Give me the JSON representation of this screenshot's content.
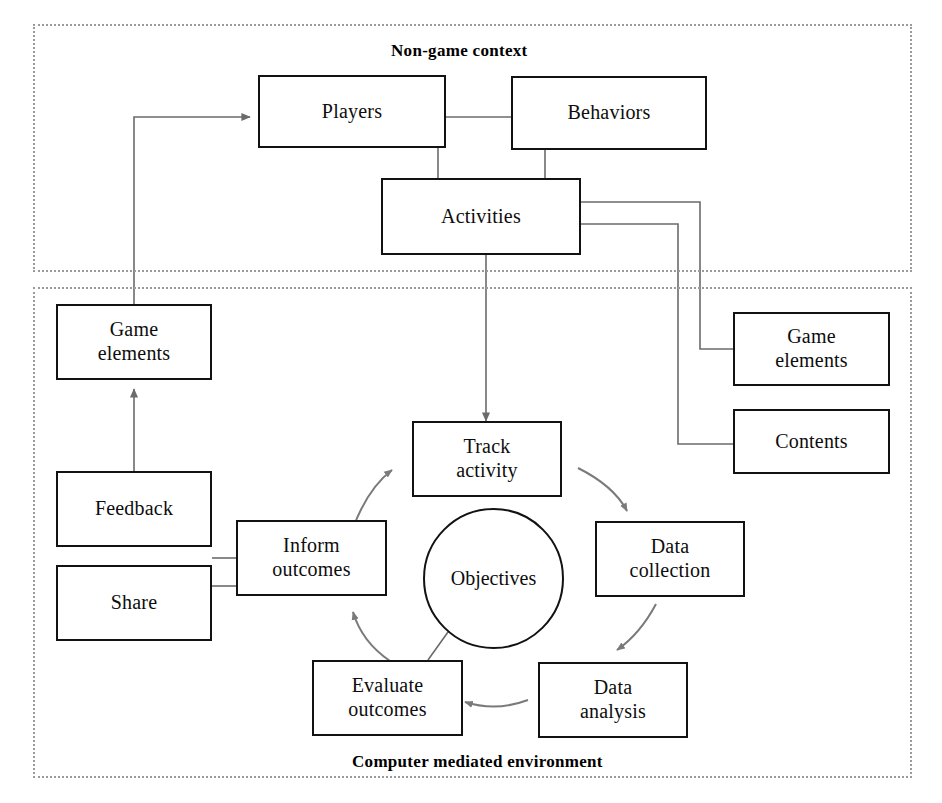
{
  "diagram": {
    "regions": [
      {
        "id": "non-game-context",
        "label": "Non-game context",
        "label_position": "top-center"
      },
      {
        "id": "computer-mediated-environment",
        "label": "Computer mediated environment",
        "label_position": "bottom-center"
      }
    ],
    "nodes": [
      {
        "id": "players",
        "label": "Players",
        "shape": "rect",
        "region": "non-game-context"
      },
      {
        "id": "behaviors",
        "label": "Behaviors",
        "shape": "rect",
        "region": "non-game-context"
      },
      {
        "id": "activities",
        "label": "Activities",
        "shape": "rect",
        "region": "non-game-context"
      },
      {
        "id": "game-elements-left",
        "label": "Game\nelements",
        "shape": "rect",
        "region": "computer-mediated-environment"
      },
      {
        "id": "feedback",
        "label": "Feedback",
        "shape": "rect",
        "region": "computer-mediated-environment"
      },
      {
        "id": "share",
        "label": "Share",
        "shape": "rect",
        "region": "computer-mediated-environment"
      },
      {
        "id": "inform-outcomes",
        "label": "Inform\noutcomes",
        "shape": "rect",
        "region": "computer-mediated-environment"
      },
      {
        "id": "track-activity",
        "label": "Track\nactivity",
        "shape": "rect",
        "region": "computer-mediated-environment"
      },
      {
        "id": "objectives",
        "label": "Objectives",
        "shape": "circle",
        "region": "computer-mediated-environment"
      },
      {
        "id": "data-collection",
        "label": "Data\ncollection",
        "shape": "rect",
        "region": "computer-mediated-environment"
      },
      {
        "id": "data-analysis",
        "label": "Data\nanalysis",
        "shape": "rect",
        "region": "computer-mediated-environment"
      },
      {
        "id": "evaluate-outcomes",
        "label": "Evaluate\noutcomes",
        "shape": "rect",
        "region": "computer-mediated-environment"
      },
      {
        "id": "game-elements-right",
        "label": "Game\nelements",
        "shape": "rect",
        "region": "computer-mediated-environment"
      },
      {
        "id": "contents",
        "label": "Contents",
        "shape": "rect",
        "region": "computer-mediated-environment"
      }
    ],
    "edges": [
      {
        "from": "players",
        "to": "behaviors",
        "style": "plain-line"
      },
      {
        "from": "players",
        "to": "activities",
        "style": "plain-line"
      },
      {
        "from": "behaviors",
        "to": "activities",
        "style": "plain-line"
      },
      {
        "from": "activities",
        "to": "track-activity",
        "style": "arrow"
      },
      {
        "from": "activities",
        "to": "game-elements-right",
        "style": "plain-line"
      },
      {
        "from": "activities",
        "to": "contents",
        "style": "plain-line"
      },
      {
        "from": "game-elements-left",
        "to": "players",
        "style": "arrow"
      },
      {
        "from": "feedback",
        "to": "game-elements-left",
        "style": "arrow"
      },
      {
        "from": "inform-outcomes",
        "to": "feedback",
        "style": "plain-line"
      },
      {
        "from": "inform-outcomes",
        "to": "share",
        "style": "plain-line"
      },
      {
        "from": "inform-outcomes",
        "to": "track-activity",
        "style": "curved-arrow"
      },
      {
        "from": "track-activity",
        "to": "data-collection",
        "style": "curved-arrow"
      },
      {
        "from": "data-collection",
        "to": "data-analysis",
        "style": "curved-arrow"
      },
      {
        "from": "data-analysis",
        "to": "evaluate-outcomes",
        "style": "curved-arrow"
      },
      {
        "from": "evaluate-outcomes",
        "to": "inform-outcomes",
        "style": "curved-arrow"
      },
      {
        "from": "objectives",
        "to": "evaluate-outcomes",
        "style": "plain-line"
      }
    ],
    "colors": {
      "node_border": "#121212",
      "connector": "#6b6b6b",
      "region_border": "#9a9a9a",
      "text": "#0d0d0d",
      "background": "#ffffff"
    }
  }
}
